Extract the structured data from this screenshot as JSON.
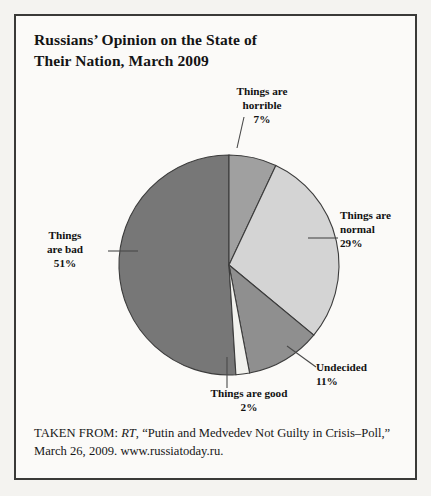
{
  "title": "Russians’ Opinion on the State of\nTheir Nation, March 2009",
  "title_line1": "Russians’ Opinion on the State of",
  "title_line2": "Their Nation, March 2009",
  "source": {
    "prefix": "TAKEN FROM: ",
    "publication": "RT",
    "rest": ", “Putin and Medvedev Not Guilty in Crisis–Poll,” March 26, 2009. www.russiatoday.ru.",
    "full": "TAKEN FROM: RT, “Putin and Medvedev Not Guilty in Crisis–Poll,” March 26, 2009. www.russiatoday.ru."
  },
  "labels": {
    "horrible": {
      "name_line1": "Things are",
      "name_line2": "horrible",
      "percent": "7%"
    },
    "normal": {
      "name_line1": "Things are",
      "name_line2": "normal",
      "percent": "29%"
    },
    "bad": {
      "name_line1": "Things",
      "name_line2": "are bad",
      "percent": "51%"
    },
    "undecided": {
      "name_line1": "Undecided",
      "name_line2": "",
      "percent": "11%"
    },
    "good": {
      "name_line1": "Things are good",
      "name_line2": "",
      "percent": "2%"
    }
  },
  "chart_data": {
    "type": "pie",
    "title": "Russians’ Opinion on the State of Their Nation, March 2009",
    "categories": [
      "Things are horrible",
      "Things are normal",
      "Undecided",
      "Things are good",
      "Things are bad"
    ],
    "values": [
      7,
      29,
      11,
      2,
      51
    ],
    "unit": "percent",
    "start_angle_deg": 0,
    "direction": "clockwise",
    "colors": [
      "#a0a0a0",
      "#d4d4d4",
      "#8f8f8f",
      "#f2f2ee",
      "#777777"
    ],
    "stroke": "#3c3c3c",
    "legend": "none",
    "labels_position": "outside-with-leader-lines",
    "center": {
      "x": 213,
      "y": 249
    },
    "radius": 110
  }
}
